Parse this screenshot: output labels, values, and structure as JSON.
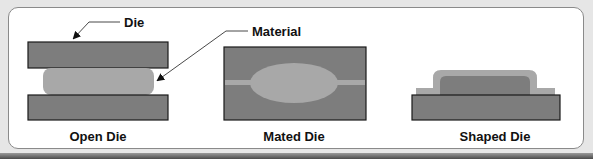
{
  "diagram": {
    "callouts": {
      "die": "Die",
      "material": "Material"
    },
    "panels": [
      {
        "id": "open-die",
        "caption": "Open Die"
      },
      {
        "id": "mated-die",
        "caption": "Mated Die"
      },
      {
        "id": "shaped-die",
        "caption": "Shaped Die"
      }
    ],
    "colors": {
      "die_fill": "#7d7d7d",
      "material_fill": "#a8a8a8",
      "outline": "#1a1a1a",
      "frame_border": "#8a8a8a",
      "background": "#e6e6e6"
    }
  }
}
